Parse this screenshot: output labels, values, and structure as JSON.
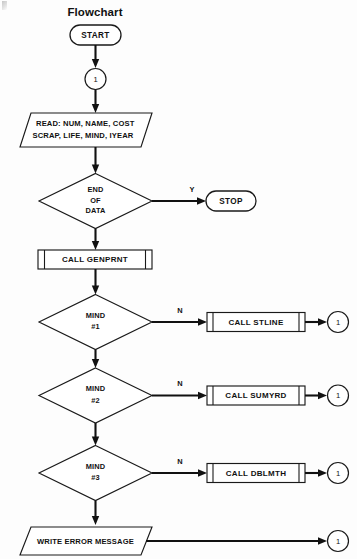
{
  "diagram": {
    "title": "Flowchart",
    "type": "program-flowchart",
    "background_color": "#fdfdfd",
    "line_color": "#111111",
    "shape_fill": "#ffffff"
  },
  "nodes": {
    "start": {
      "label": "START",
      "shape": "terminator"
    },
    "connector_top": {
      "label": "1",
      "shape": "connector"
    },
    "read": {
      "line1": "READ: NUM, NAME, COST",
      "line2": "SCRAP, LIFE, MIND, IYEAR",
      "shape": "input-output"
    },
    "end_of_data": {
      "line1": "END",
      "line2": "OF",
      "line3": "DATA",
      "shape": "decision"
    },
    "stop": {
      "label": "STOP",
      "shape": "terminator"
    },
    "genprnt": {
      "label": "CALL GENPRNT",
      "shape": "predefined-process"
    },
    "mind1": {
      "line1": "MIND",
      "line2": "#1",
      "shape": "decision"
    },
    "stline": {
      "label": "CALL STLINE",
      "shape": "predefined-process"
    },
    "connector_stline": {
      "label": "1",
      "shape": "connector"
    },
    "mind2": {
      "line1": "MIND",
      "line2": "#2",
      "shape": "decision"
    },
    "sumyrd": {
      "label": "CALL SUMYRD",
      "shape": "predefined-process"
    },
    "connector_sumyrd": {
      "label": "1",
      "shape": "connector"
    },
    "mind3": {
      "line1": "MIND",
      "line2": "#3",
      "shape": "decision"
    },
    "dblmth": {
      "label": "CALL DBLMTH",
      "shape": "predefined-process"
    },
    "connector_dblmth": {
      "label": "1",
      "shape": "connector"
    },
    "write_error": {
      "label": "WRITE ERROR MESSAGE",
      "shape": "input-output"
    },
    "connector_bottom": {
      "label": "1",
      "shape": "connector"
    }
  },
  "branch_labels": {
    "end_of_data_yes": "Y",
    "mind1_no": "N",
    "mind2_no": "N",
    "mind3_no": "N"
  }
}
